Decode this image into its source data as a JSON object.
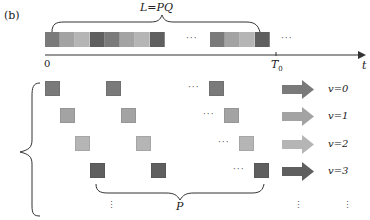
{
  "panel_label": "(b)",
  "colors": {
    "v0": "#7a7a7a",
    "v1": "#a3a3a3",
    "v2": "#b5b5b5",
    "v3": "#5f5f5f",
    "axis": "#333333"
  },
  "top_row": {
    "brace_label": "L=PQ",
    "cells_left": [
      "v0",
      "v1",
      "v2",
      "v3",
      "v0",
      "v1",
      "v2",
      "v3"
    ],
    "cells_right": [
      "v0",
      "v1",
      "v2",
      "v3"
    ],
    "ellipsis": "···"
  },
  "axis": {
    "origin_label": "0",
    "t0_label": "T",
    "t0_sub": "0",
    "end_label": "t"
  },
  "rows": [
    {
      "label": "v=0",
      "color_key": "v0"
    },
    {
      "label": "v=1",
      "color_key": "v1"
    },
    {
      "label": "v=2",
      "color_key": "v2"
    },
    {
      "label": "v=3",
      "color_key": "v3"
    }
  ],
  "bottom_brace_label": "P",
  "ellipsis": "···",
  "vellipsis": "⋮"
}
